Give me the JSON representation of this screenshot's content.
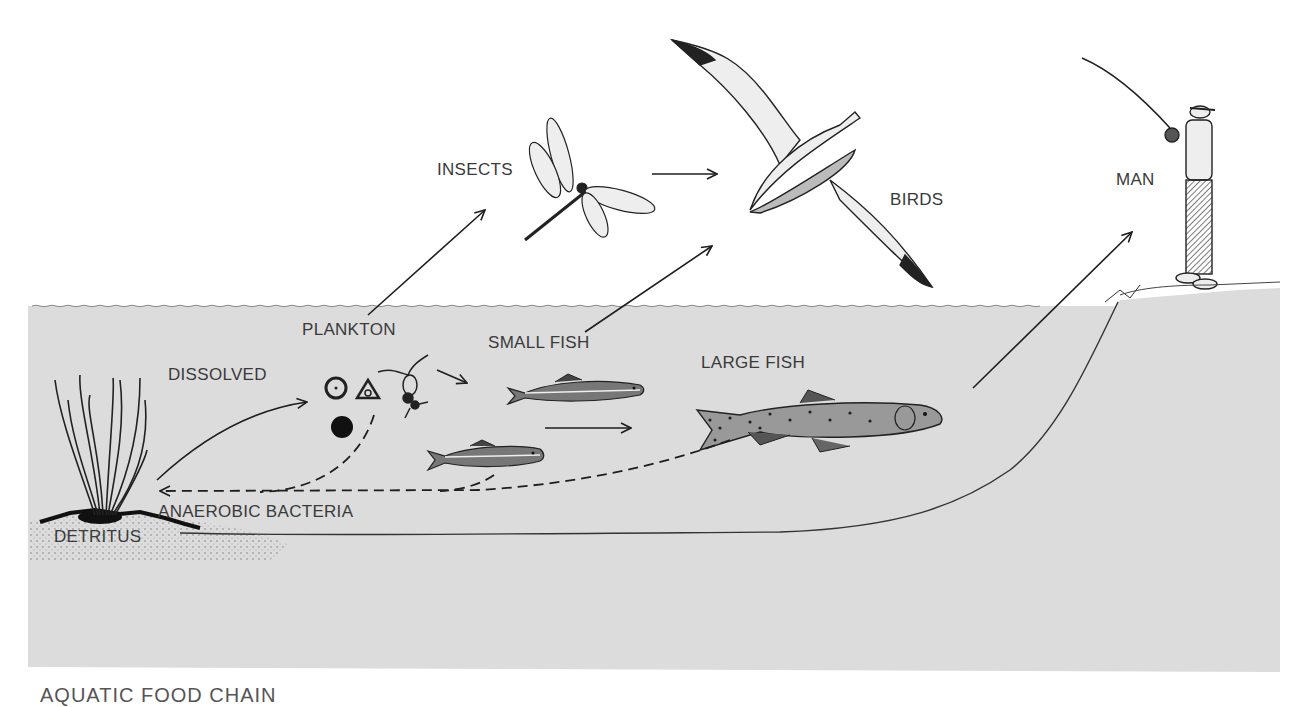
{
  "diagram": {
    "type": "aquatic food chain",
    "labels": {
      "insects": "INSECTS",
      "birds": "BIRDS",
      "man": "MAN",
      "plankton": "PLANKTON",
      "dissolved_1": "DISSOLVED",
      "dissolved_2": "SUBSTANCES",
      "small_fish": "SMALL FISH",
      "large_fish": "LARGE FISH",
      "bacteria": "ANAEROBIC BACTERIA",
      "detritus": "DETRITUS"
    },
    "caption": "AQUATIC FOOD CHAIN",
    "flows": [
      {
        "from": "DETRITUS",
        "to": "DISSOLVED SUBSTANCES",
        "style": "solid"
      },
      {
        "from": "DISSOLVED SUBSTANCES",
        "to": "PLANKTON",
        "style": "solid"
      },
      {
        "from": "PLANKTON",
        "to": "INSECTS",
        "style": "solid"
      },
      {
        "from": "PLANKTON",
        "to": "SMALL FISH",
        "style": "solid"
      },
      {
        "from": "INSECTS",
        "to": "BIRDS",
        "style": "solid"
      },
      {
        "from": "SMALL FISH",
        "to": "BIRDS",
        "style": "solid"
      },
      {
        "from": "SMALL FISH",
        "to": "LARGE FISH",
        "style": "solid"
      },
      {
        "from": "LARGE FISH",
        "to": "MAN",
        "style": "solid"
      },
      {
        "from": "PLANKTON",
        "to": "ANAEROBIC BACTERIA",
        "style": "dashed"
      },
      {
        "from": "SMALL FISH",
        "to": "ANAEROBIC BACTERIA",
        "style": "dashed"
      },
      {
        "from": "LARGE FISH",
        "to": "ANAEROBIC BACTERIA",
        "style": "dashed"
      }
    ],
    "colors": {
      "water": "#dcdcdc",
      "ink": "#1e1e1e",
      "label": "#3a3a3a",
      "background": "#ffffff"
    }
  }
}
